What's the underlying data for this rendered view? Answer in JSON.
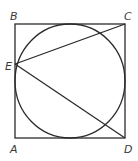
{
  "diagram": {
    "type": "geometry",
    "points": {
      "A": {
        "label": "A",
        "x": 15,
        "y": 138
      },
      "B": {
        "label": "B",
        "x": 15,
        "y": 24
      },
      "C": {
        "label": "C",
        "x": 125,
        "y": 24
      },
      "D": {
        "label": "D",
        "x": 125,
        "y": 138
      },
      "E": {
        "label": "E",
        "x": 15,
        "y": 81
      }
    },
    "labels": {
      "A": "A",
      "B": "B",
      "C": "C",
      "D": "D",
      "E": "E"
    },
    "circle": {
      "cx": 70,
      "cy": 81,
      "rx": 55,
      "ry": 57
    },
    "segments": [
      {
        "from": "E",
        "to": "C"
      },
      {
        "from": "E",
        "to": "D"
      }
    ],
    "colors": {
      "line": "#2b2b2b",
      "label": "#3a3a3a",
      "background": "#ffffff"
    }
  }
}
